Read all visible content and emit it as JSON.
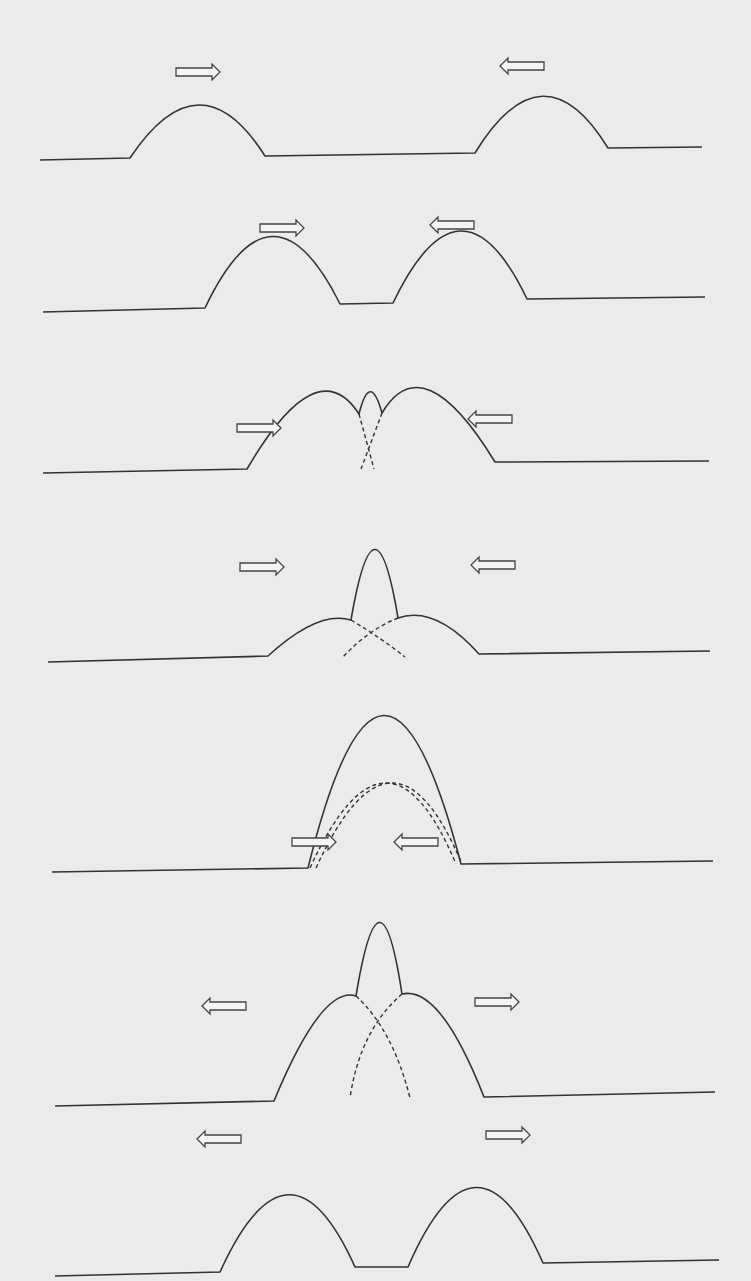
{
  "figure": {
    "background": "#ebebeb",
    "stroke_color": "#333333",
    "frames": [
      {
        "id": 1,
        "stage": "approaching",
        "baseline": [
          [
            40,
            160
          ],
          [
            130,
            158
          ],
          [
            265,
            156
          ],
          [
            475,
            153
          ],
          [
            608,
            148
          ],
          [
            702,
            147
          ]
        ],
        "solid_paths": [
          "M40,160 L130,158 Q200,53 265,156 L475,153 Q543,42 608,148 L702,147"
        ],
        "dashed_paths": [],
        "arrows": [
          {
            "x": 176,
            "y": 72,
            "dir": "right"
          },
          {
            "x": 544,
            "y": 66,
            "dir": "left"
          }
        ]
      },
      {
        "id": 2,
        "stage": "approaching",
        "solid_paths": [
          "M43,312 L205,308 Q272,167 340,304 L393,303 Q461,161 527,299 L705,297"
        ],
        "dashed_paths": [],
        "arrows": [
          {
            "x": 260,
            "y": 228,
            "dir": "right"
          },
          {
            "x": 474,
            "y": 225,
            "dir": "left"
          }
        ]
      },
      {
        "id": 3,
        "stage": "beginning to overlap",
        "solid_paths": [
          "M43,473 L247,469 Q317,349 359,414 Q370,370 382,413 Q423,344 495,462 L709,461"
        ],
        "dashed_paths": [
          "M359,414 L374,469",
          "M382,413 L361,469"
        ],
        "arrows": [
          {
            "x": 237,
            "y": 428,
            "dir": "right"
          },
          {
            "x": 512,
            "y": 419,
            "dir": "left"
          }
        ]
      },
      {
        "id": 4,
        "stage": "overlapping",
        "solid_paths": [
          "M48,662 L268,656 Q318,610 351,620 Q375,480 398,618 Q435,605 479,654 L710,651"
        ],
        "dashed_paths": [
          "M351,620 Q384,640 405,657",
          "M398,618 Q368,630 343,657"
        ],
        "arrows": [
          {
            "x": 240,
            "y": 567,
            "dir": "right"
          },
          {
            "x": 515,
            "y": 565,
            "dir": "left"
          }
        ]
      },
      {
        "id": 5,
        "stage": "complete overlap - maximum amplitude",
        "solid_paths": [
          "M52,872 L308,868 Q383,565 461,864 L713,861"
        ],
        "dashed_paths": [
          "M310,868 Q387,700 456,864",
          "M316,868 Q393,700 462,864"
        ],
        "arrows": [
          {
            "x": 292,
            "y": 842,
            "dir": "right"
          },
          {
            "x": 438,
            "y": 842,
            "dir": "left"
          }
        ]
      },
      {
        "id": 6,
        "stage": "separating",
        "solid_paths": [
          "M55,1106 L274,1101 Q322,985 356,996 Q380,850 402,994 Q440,985 484,1097 L715,1092"
        ],
        "dashed_paths": [
          "M356,996 Q393,1030 410,1098",
          "M402,994 Q360,1030 350,1098"
        ],
        "arrows": [
          {
            "x": 246,
            "y": 1006,
            "dir": "left"
          },
          {
            "x": 475,
            "y": 1002,
            "dir": "right"
          }
        ]
      },
      {
        "id": 7,
        "stage": "separated - pulses continue unchanged",
        "solid_paths": [
          "M55,1276 L220,1272 Q289,1120 355,1267 L408,1267 Q476,1110 543,1263 L719,1260"
        ],
        "dashed_paths": [],
        "arrows": [
          {
            "x": 241,
            "y": 1139,
            "dir": "left"
          },
          {
            "x": 486,
            "y": 1135,
            "dir": "right"
          }
        ]
      }
    ]
  }
}
